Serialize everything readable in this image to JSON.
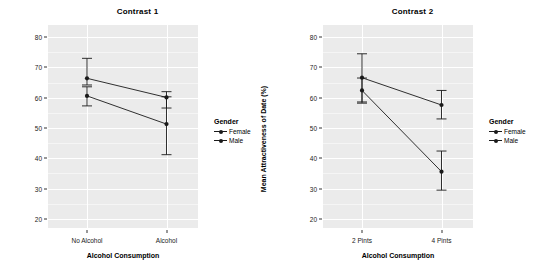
{
  "figure": {
    "background": "#ffffff",
    "panel_background": "#ebebeb",
    "gridline_color": "#ffffff",
    "series_color": "#1a1a1a"
  },
  "legend": {
    "title": "Gender",
    "items": [
      {
        "label": "Female",
        "key": "point-line-key"
      },
      {
        "label": "Male",
        "key": "point-line-key"
      }
    ]
  },
  "panels": [
    {
      "id": "contrast-1",
      "title": "Contrast 1",
      "xlabel": "Alcohol Consumption",
      "ylabel": "Mean Attractiveness of Date (%)",
      "categories": [
        "No Alcohol",
        "Alcohol"
      ],
      "yticks": [
        20,
        30,
        40,
        50,
        60,
        70,
        80
      ]
    },
    {
      "id": "contrast-2",
      "title": "Contrast 2",
      "xlabel": "Alcohol Consumption",
      "ylabel": "Mean Attractiveness of Date (%)",
      "categories": [
        "2 Pints",
        "4 Pints"
      ],
      "yticks": [
        20,
        30,
        40,
        50,
        60,
        70,
        80
      ]
    }
  ],
  "chart_data": [
    {
      "type": "line",
      "title": "Contrast 1",
      "xlabel": "Alcohol Consumption",
      "ylabel": "Mean Attractiveness of Date (%)",
      "categories": [
        "No Alcohol",
        "Alcohol"
      ],
      "ylim": [
        17,
        84
      ],
      "yticks": [
        20,
        30,
        40,
        50,
        60,
        70,
        80
      ],
      "grid": true,
      "legend_position": "right",
      "error_bars": "95% confidence interval",
      "series": [
        {
          "name": "Female",
          "values": [
            66.4,
            60.1
          ],
          "err_low": [
            64.2,
            56.6
          ],
          "err_high": [
            73.0,
            62.0
          ]
        },
        {
          "name": "Male",
          "values": [
            60.6,
            51.3
          ],
          "err_low": [
            57.3,
            41.2
          ],
          "err_high": [
            63.6,
            60.3
          ]
        }
      ]
    },
    {
      "type": "line",
      "title": "Contrast 2",
      "xlabel": "Alcohol Consumption",
      "ylabel": "Mean Attractiveness of Date (%)",
      "categories": [
        "2 Pints",
        "4 Pints"
      ],
      "ylim": [
        17,
        84
      ],
      "yticks": [
        20,
        30,
        40,
        50,
        60,
        70,
        80
      ],
      "grid": true,
      "legend_position": "right",
      "error_bars": "95% confidence interval",
      "series": [
        {
          "name": "Female",
          "values": [
            66.6,
            57.6
          ],
          "err_low": [
            58.6,
            53.0
          ],
          "err_high": [
            74.5,
            62.4
          ]
        },
        {
          "name": "Male",
          "values": [
            62.4,
            35.6
          ],
          "err_low": [
            58.2,
            29.5
          ],
          "err_high": [
            66.5,
            42.4
          ]
        }
      ]
    }
  ]
}
